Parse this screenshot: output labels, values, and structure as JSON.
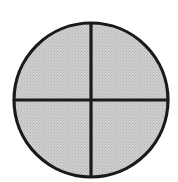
{
  "figure": {
    "title": "Quartered circle",
    "caption": "",
    "background_color": "#ffffff",
    "width": 178,
    "height": 182
  },
  "diagram": {
    "type": "line-art",
    "shapes": [
      {
        "name": "circle",
        "label": "Circle outline",
        "cx": 91,
        "cy": 100,
        "r": 77,
        "stroke_color": "#1a1a1a",
        "stroke_width": 3.2,
        "fill_color": "#c8c8c8",
        "fill_style": "halftone-dither"
      },
      {
        "name": "vertical-divider",
        "label": "Vertical dividing line",
        "x1": 91,
        "y1": 23,
        "x2": 91,
        "y2": 177,
        "stroke_color": "#1a1a1a",
        "stroke_width": 3.2
      },
      {
        "name": "horizontal-divider",
        "label": "Horizontal dividing line",
        "x1": 14,
        "y1": 100,
        "x2": 168,
        "y2": 100,
        "stroke_color": "#1a1a1a",
        "stroke_width": 3.2
      }
    ],
    "quadrants": [
      {
        "name": "upper-left",
        "label": "Upper left quadrant"
      },
      {
        "name": "upper-right",
        "label": "Upper right quadrant"
      },
      {
        "name": "lower-left",
        "label": "Lower left quadrant"
      },
      {
        "name": "lower-right",
        "label": "Lower right quadrant"
      }
    ]
  }
}
